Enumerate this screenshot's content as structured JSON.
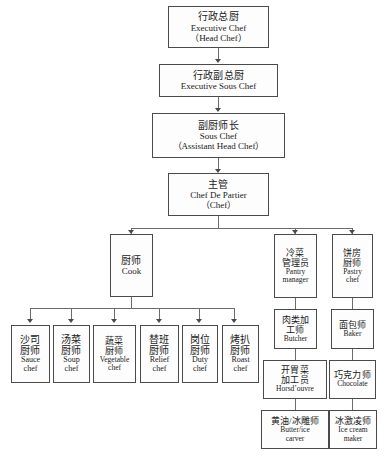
{
  "chart": {
    "type": "org-chart",
    "nodes": {
      "executive_chef": {
        "cn": "行政总厨",
        "en": "Executive Chef",
        "en2": "（Head Chef）"
      },
      "executive_sous_chef": {
        "cn": "行政副总厨",
        "en": "Executive Sous Chef",
        "en2": ""
      },
      "sous_chef": {
        "cn": "副厨师长",
        "en": "Sous Chef",
        "en2": "（Assistant Head Chef）"
      },
      "chef_de_partier": {
        "cn": "主管",
        "en": "Chef De Partier",
        "en2": "（Chef）"
      },
      "cook": {
        "cn": "厨师",
        "en": "Cook",
        "en2": ""
      },
      "pantry_manager": {
        "cn": "冷菜",
        "cn2": "管理员",
        "en": "Pantry",
        "en2": "manager"
      },
      "pastry_chef": {
        "cn": "饼房",
        "cn2": "厨师",
        "en": "Pastry",
        "en2": "chef"
      },
      "sauce_chef": {
        "cn": "沙司",
        "cn2": "厨师",
        "en": "Sauce",
        "en2": "chef"
      },
      "soup_chef": {
        "cn": "汤菜",
        "cn2": "厨师",
        "en": "Soup",
        "en2": "chef"
      },
      "vegetable_chef": {
        "cn": "蔬菜",
        "cn2": "厨师",
        "en": "Vegetable",
        "en2": "chef"
      },
      "relief_chef": {
        "cn": "替班",
        "cn2": "厨师",
        "en": "Relief",
        "en2": "chef"
      },
      "duty_chef": {
        "cn": "岗位",
        "cn2": "厨师",
        "en": "Duty",
        "en2": "chef"
      },
      "roast_chef": {
        "cn": "烤扒",
        "cn2": "厨师",
        "en": "Roast",
        "en2": "chef"
      },
      "butcher": {
        "cn": "肉类加",
        "cn2": "工师",
        "en": "Butcher",
        "en2": ""
      },
      "horsdouvre": {
        "cn": "开胃菜",
        "cn2": "加工员",
        "en": "Horsd’ouvre",
        "en2": ""
      },
      "butter_ice_carver": {
        "cn": "黄油/冰雕师",
        "cn2": "",
        "en": "Butter/ice",
        "en2": "carver"
      },
      "baker": {
        "cn": "面包师",
        "cn2": "",
        "en": "Baker",
        "en2": ""
      },
      "chocolate": {
        "cn": "巧克力师",
        "cn2": "",
        "en": "Chocolate",
        "en2": ""
      },
      "ice_cream_maker": {
        "cn": "冰激凌师",
        "cn2": "",
        "en": "Ice cream",
        "en2": "maker"
      }
    },
    "colors": {
      "box_border": "#4a4a4a",
      "connector": "#6b6b6b",
      "background": "#ffffff",
      "text": "#1a1a1a"
    }
  }
}
